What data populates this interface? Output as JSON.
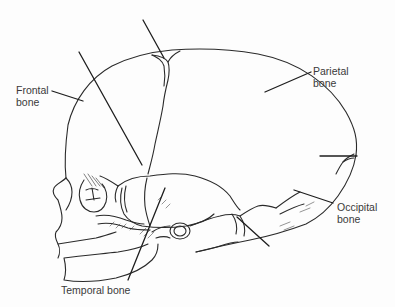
{
  "figure": {
    "line_color": "#2a2a2a",
    "background": "#fdfdfd"
  },
  "labels": {
    "frontal": "Frontal\nbone",
    "parietal": "Parietal\nbone",
    "occipital": "Occipital\nbone",
    "temporal": "Temporal bone"
  },
  "unlabeled_leaders": [
    {
      "name": "anterior-fontanel-leader",
      "label": ""
    },
    {
      "name": "sphenoid-fontanel-leader",
      "label": ""
    },
    {
      "name": "posterior-fontanel-leader",
      "label": ""
    },
    {
      "name": "mastoid-fontanel-leader",
      "label": ""
    }
  ]
}
